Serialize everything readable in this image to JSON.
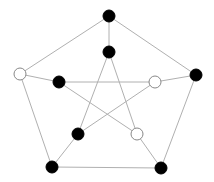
{
  "diagram": {
    "type": "graph",
    "name": "Petersen graph",
    "edge_color": "#b0b0b0",
    "node_radius": 6,
    "colors": {
      "black": "#000000",
      "white": "#ffffff",
      "stroke": "#888888"
    },
    "nodes": [
      {
        "id": "o0",
        "ring": "outer",
        "x": 109,
        "y": 16,
        "fill": "black"
      },
      {
        "id": "o1",
        "ring": "outer",
        "x": 196,
        "y": 75,
        "fill": "black"
      },
      {
        "id": "o2",
        "ring": "outer",
        "x": 161,
        "y": 168,
        "fill": "black"
      },
      {
        "id": "o3",
        "ring": "outer",
        "x": 52,
        "y": 167,
        "fill": "black"
      },
      {
        "id": "o4",
        "ring": "outer",
        "x": 20,
        "y": 74,
        "fill": "white"
      },
      {
        "id": "i0",
        "ring": "inner",
        "x": 109,
        "y": 52,
        "fill": "black"
      },
      {
        "id": "i1",
        "ring": "inner",
        "x": 155,
        "y": 82,
        "fill": "white"
      },
      {
        "id": "i2",
        "ring": "inner",
        "x": 137,
        "y": 134,
        "fill": "white"
      },
      {
        "id": "i3",
        "ring": "inner",
        "x": 78,
        "y": 134,
        "fill": "black"
      },
      {
        "id": "i4",
        "ring": "inner",
        "x": 59,
        "y": 82,
        "fill": "black"
      }
    ],
    "edges": [
      [
        "o0",
        "o1"
      ],
      [
        "o1",
        "o2"
      ],
      [
        "o2",
        "o3"
      ],
      [
        "o3",
        "o4"
      ],
      [
        "o4",
        "o0"
      ],
      [
        "o0",
        "i0"
      ],
      [
        "o1",
        "i1"
      ],
      [
        "o2",
        "i2"
      ],
      [
        "o3",
        "i3"
      ],
      [
        "o4",
        "i4"
      ],
      [
        "i0",
        "i2"
      ],
      [
        "i2",
        "i4"
      ],
      [
        "i4",
        "i1"
      ],
      [
        "i1",
        "i3"
      ],
      [
        "i3",
        "i0"
      ]
    ]
  }
}
